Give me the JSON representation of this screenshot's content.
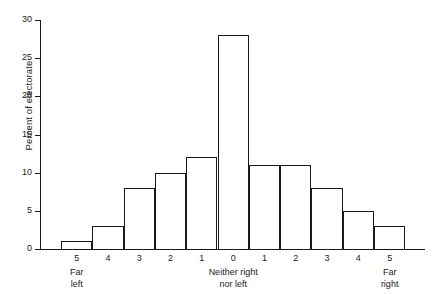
{
  "chart_data": {
    "type": "bar",
    "title": "",
    "subtitle": "",
    "xlabel": "",
    "ylabel": "Percent of electorate",
    "categories": [
      "5",
      "4",
      "3",
      "2",
      "1",
      "0",
      "1",
      "2",
      "3",
      "4",
      "5"
    ],
    "values": [
      1,
      3,
      8,
      10,
      12,
      28,
      11,
      11,
      8,
      5,
      3
    ],
    "ylim": [
      0,
      30
    ],
    "yticks": [
      0,
      5,
      10,
      15,
      20,
      25,
      30
    ],
    "ytick_labels": [
      "0",
      "5",
      "10",
      "15",
      "20",
      "25",
      "30"
    ],
    "grid": false,
    "legend": null,
    "annotations": [
      {
        "name": "far-left",
        "lines": [
          "Far",
          "left"
        ],
        "at_category_index": 0
      },
      {
        "name": "neither-right-nor-left",
        "lines": [
          "Neither right",
          "nor left"
        ],
        "at_category_index": 5
      },
      {
        "name": "far-right",
        "lines": [
          "Far",
          "right"
        ],
        "at_category_index": 10
      }
    ],
    "colors": {
      "bar_edge": "#1a1a1a",
      "bar_fill": "#ffffff",
      "axis": "#1a1a1a",
      "background": "#ffffff"
    }
  }
}
